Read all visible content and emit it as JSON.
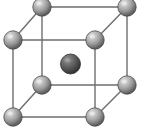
{
  "figure": {
    "type": "crystal-lattice-diagram",
    "width": 144,
    "height": 134,
    "background_color": "#ffffff"
  },
  "colors": {
    "background": "#ffffff",
    "edge_line": "#6e6e6e",
    "corner_atom_highlight": "#d8d8d8",
    "corner_atom_mid": "#9a9a9a",
    "corner_atom_shadow": "#5a5a5a",
    "corner_atom_outline": "#4a4a4a",
    "center_atom_highlight": "#8a8a8a",
    "center_atom_mid": "#5c5c5c",
    "center_atom_shadow": "#3a3a3a",
    "center_atom_outline": "#2e2e2e"
  },
  "geometry": {
    "edge_stroke_width": 1.4,
    "corner_atom_radius": 9.2,
    "center_atom_radius": 10.0,
    "front_face": {
      "top_left": {
        "x": 13,
        "y": 40
      },
      "top_right": {
        "x": 95,
        "y": 40
      },
      "bottom_left": {
        "x": 13,
        "y": 117
      },
      "bottom_right": {
        "x": 95,
        "y": 117
      }
    },
    "back_face": {
      "top_left": {
        "x": 42,
        "y": 7
      },
      "top_right": {
        "x": 127,
        "y": 7
      },
      "bottom_left": {
        "x": 42,
        "y": 85
      },
      "bottom_right": {
        "x": 127,
        "y": 85
      }
    },
    "center": {
      "x": 70.5,
      "y": 64
    }
  },
  "atoms": [
    {
      "id": "corner-back-top-left",
      "label": "corner atom",
      "kind": "corner",
      "cx": 42,
      "cy": 7,
      "r": 9.2
    },
    {
      "id": "corner-back-top-right",
      "label": "corner atom",
      "kind": "corner",
      "cx": 127,
      "cy": 7,
      "r": 9.2
    },
    {
      "id": "corner-front-top-left",
      "label": "corner atom",
      "kind": "corner",
      "cx": 13,
      "cy": 40,
      "r": 9.2
    },
    {
      "id": "corner-front-top-right",
      "label": "corner atom",
      "kind": "corner",
      "cx": 95,
      "cy": 40,
      "r": 9.2
    },
    {
      "id": "corner-back-bottom-left",
      "label": "corner atom",
      "kind": "corner",
      "cx": 42,
      "cy": 85,
      "r": 9.2
    },
    {
      "id": "corner-back-bottom-right",
      "label": "corner atom",
      "kind": "corner",
      "cx": 127,
      "cy": 85,
      "r": 9.2
    },
    {
      "id": "corner-front-bottom-left",
      "label": "corner atom",
      "kind": "corner",
      "cx": 13,
      "cy": 117,
      "r": 9.2
    },
    {
      "id": "corner-front-bottom-right",
      "label": "corner atom",
      "kind": "corner",
      "cx": 95,
      "cy": 117,
      "r": 9.2
    },
    {
      "id": "center-body",
      "label": "body-center atom",
      "kind": "center",
      "cx": 70.5,
      "cy": 64,
      "r": 10.0
    }
  ],
  "edges": [
    {
      "id": "front-top",
      "x1": 13,
      "y1": 40,
      "x2": 95,
      "y2": 40
    },
    {
      "id": "front-bottom",
      "x1": 13,
      "y1": 117,
      "x2": 95,
      "y2": 117
    },
    {
      "id": "front-left",
      "x1": 13,
      "y1": 40,
      "x2": 13,
      "y2": 117
    },
    {
      "id": "front-right",
      "x1": 95,
      "y1": 40,
      "x2": 95,
      "y2": 117
    },
    {
      "id": "back-top",
      "x1": 42,
      "y1": 7,
      "x2": 127,
      "y2": 7
    },
    {
      "id": "back-bottom",
      "x1": 42,
      "y1": 85,
      "x2": 127,
      "y2": 85
    },
    {
      "id": "back-left",
      "x1": 42,
      "y1": 7,
      "x2": 42,
      "y2": 85
    },
    {
      "id": "back-right",
      "x1": 127,
      "y1": 7,
      "x2": 127,
      "y2": 85
    },
    {
      "id": "depth-top-left",
      "x1": 13,
      "y1": 40,
      "x2": 42,
      "y2": 7
    },
    {
      "id": "depth-top-right",
      "x1": 95,
      "y1": 40,
      "x2": 127,
      "y2": 7
    },
    {
      "id": "depth-bottom-left",
      "x1": 13,
      "y1": 117,
      "x2": 42,
      "y2": 85
    },
    {
      "id": "depth-bottom-right",
      "x1": 95,
      "y1": 117,
      "x2": 127,
      "y2": 85
    }
  ]
}
